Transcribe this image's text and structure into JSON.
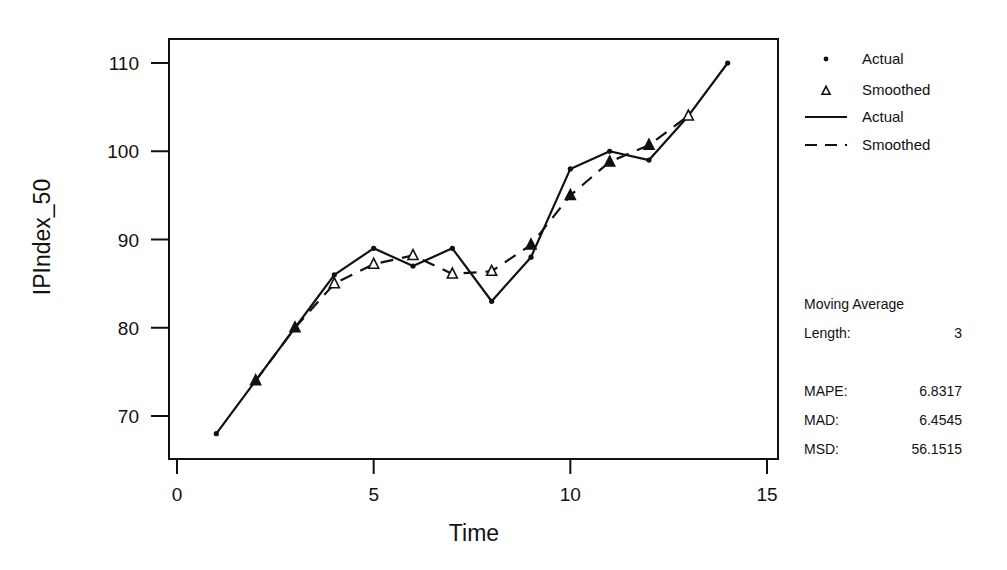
{
  "chart_data": {
    "type": "line",
    "title": "",
    "xlabel": "Time",
    "ylabel": "IPIndex_50",
    "xlim": [
      0,
      15
    ],
    "ylim": [
      65,
      112
    ],
    "x_ticks": [
      0,
      5,
      10,
      15
    ],
    "y_ticks": [
      70,
      80,
      90,
      100,
      110
    ],
    "grid": false,
    "legend_position": "right",
    "series": [
      {
        "name": "Actual",
        "marker": "dot",
        "line": "solid",
        "x": [
          1,
          2,
          3,
          4,
          5,
          6,
          7,
          8,
          9,
          10,
          11,
          12,
          13,
          14
        ],
        "values": [
          68,
          74,
          80,
          86,
          89,
          87,
          89,
          83,
          88,
          98,
          100,
          99,
          104,
          110
        ]
      },
      {
        "name": "Smoothed",
        "marker": "triangle",
        "line": "dashed",
        "x": [
          2,
          3,
          4,
          5,
          6,
          7,
          8,
          9,
          10,
          11,
          12,
          13
        ],
        "values": [
          74,
          80,
          85,
          87.2,
          88.2,
          86.1,
          86.4,
          89.4,
          95,
          98.8,
          100.7,
          104
        ]
      }
    ],
    "legend": [
      {
        "label": "Actual",
        "symbol": "dot"
      },
      {
        "label": "Smoothed",
        "symbol": "triangle"
      },
      {
        "label": "Actual",
        "symbol": "solid-line"
      },
      {
        "label": "Smoothed",
        "symbol": "dashed-line"
      }
    ],
    "annotations": {
      "method": "Moving Average",
      "length_label": "Length:",
      "length": "3",
      "metrics": [
        {
          "label": "MAPE:",
          "value": "6.8317"
        },
        {
          "label": "MAD:",
          "value": "6.4545"
        },
        {
          "label": "MSD:",
          "value": "56.1515"
        }
      ]
    }
  },
  "colors": {
    "ink": "#111111",
    "background": "#ffffff"
  }
}
